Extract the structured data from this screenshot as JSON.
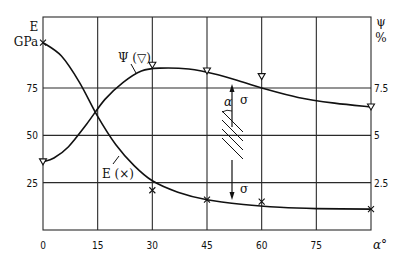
{
  "chart_data": {
    "type": "line",
    "title": "",
    "xlabel": "α°",
    "ylabel_left": "E GPa",
    "ylabel_right": "ψ %",
    "x_ticks": [
      "0",
      "15",
      "30",
      "45",
      "60",
      "75"
    ],
    "y_left_ticks": [
      "25",
      "50",
      "75"
    ],
    "y_right_ticks": [
      "2.5",
      "5",
      "7.5"
    ],
    "xlim": [
      0,
      90
    ],
    "ylim_left": [
      0,
      112.5
    ],
    "ylim_right": [
      0,
      11.25
    ],
    "grid": true,
    "series": [
      {
        "name": "E (×)",
        "axis": "left",
        "marker": "x",
        "points": [
          [
            0,
            99
          ],
          [
            30,
            21
          ],
          [
            45,
            16
          ],
          [
            60,
            15
          ],
          [
            90,
            11
          ]
        ],
        "curve": [
          [
            0,
            99
          ],
          [
            5,
            92
          ],
          [
            10,
            78
          ],
          [
            15,
            60
          ],
          [
            20,
            45
          ],
          [
            25,
            34
          ],
          [
            30,
            26
          ],
          [
            37,
            20
          ],
          [
            45,
            16
          ],
          [
            55,
            13.5
          ],
          [
            65,
            12
          ],
          [
            75,
            11.3
          ],
          [
            90,
            11
          ]
        ]
      },
      {
        "name": "ψ (▽)",
        "axis": "right",
        "marker": "triangle-down",
        "points": [
          [
            0,
            3.6
          ],
          [
            30,
            8.7
          ],
          [
            45,
            8.4
          ],
          [
            60,
            8.1
          ],
          [
            90,
            6.5
          ]
        ],
        "curve": [
          [
            0,
            3.6
          ],
          [
            3,
            3.8
          ],
          [
            7,
            4.4
          ],
          [
            12,
            5.6
          ],
          [
            17,
            6.9
          ],
          [
            22,
            7.8
          ],
          [
            27,
            8.4
          ],
          [
            32,
            8.55
          ],
          [
            40,
            8.5
          ],
          [
            48,
            8.2
          ],
          [
            55,
            7.8
          ],
          [
            60,
            7.5
          ],
          [
            70,
            7.0
          ],
          [
            80,
            6.7
          ],
          [
            90,
            6.5
          ]
        ]
      }
    ],
    "annotations": [
      {
        "text": "Ψ (▽)",
        "near": "ψ curve at α≈20"
      },
      {
        "text": "E (×)",
        "near": "E curve at α≈22"
      },
      {
        "text": "specimen sketch: σ arrows up/down, fibre angle α",
        "position": "between α=45 and α=60"
      }
    ]
  },
  "labels": {
    "left_axis_symbol": "E",
    "left_axis_unit": "GPa",
    "right_axis_symbol": "ψ",
    "right_axis_unit": "%",
    "x_axis_symbol": "α°",
    "psi_curve_label": "Ψ (▽)",
    "e_curve_label": "E (×)",
    "sigma_top": "σ",
    "sigma_bottom": "σ",
    "alpha_symbol": "α"
  }
}
